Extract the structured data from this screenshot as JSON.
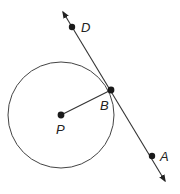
{
  "diagram": {
    "colors": {
      "stroke": "#333333",
      "point": "#1a1a1a",
      "background": "#ffffff"
    },
    "circle": {
      "center_label": "P",
      "cx": 61,
      "cy": 115,
      "r": 53
    },
    "points": [
      {
        "id": "D",
        "label": "D",
        "x": 72,
        "y": 27,
        "label_x": 82,
        "label_y": 32
      },
      {
        "id": "B",
        "label": "B",
        "x": 111,
        "y": 90,
        "label_x": 99,
        "label_y": 110
      },
      {
        "id": "P",
        "label": "P",
        "x": 61,
        "y": 115,
        "label_x": 56,
        "label_y": 134
      },
      {
        "id": "A",
        "label": "A",
        "x": 152,
        "y": 156,
        "label_x": 160,
        "label_y": 161
      }
    ],
    "segments": [
      {
        "name": "radius-PB",
        "from": "P",
        "to": "B"
      }
    ],
    "lines": [
      {
        "name": "tangent-line-DA",
        "through": [
          "D",
          "B",
          "A"
        ],
        "arrow_start": [
          62,
          10
        ],
        "arrow_end": [
          166,
          183
        ]
      }
    ]
  }
}
